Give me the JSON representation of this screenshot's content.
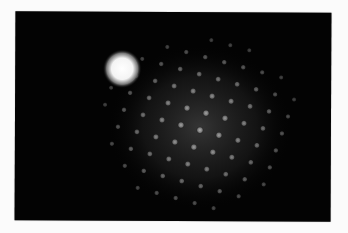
{
  "image": {
    "subject": "electron diffraction pattern",
    "background_color": "#fbfbfb",
    "photo_background": "#030303",
    "central_beam": {
      "cx": 107,
      "cy": 57,
      "r": 13,
      "color": "#ffffff"
    },
    "glow": {
      "cx": 185,
      "cy": 115,
      "rx": 95,
      "ry": 85,
      "color": "#3a3a3a"
    },
    "lattice": {
      "origin": [
        185,
        118
      ],
      "a": [
        19,
        5
      ],
      "b": [
        -6,
        17
      ],
      "range_i": [
        -5,
        5
      ],
      "range_j": [
        -5,
        5
      ],
      "spot_radius": 3.2,
      "spot_color": "#9a9a9a"
    }
  }
}
